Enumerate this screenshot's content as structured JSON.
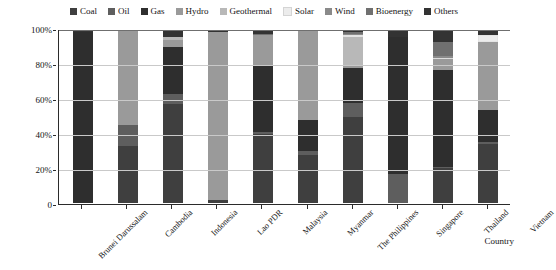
{
  "chart_data": {
    "type": "bar",
    "subtype": "stacked-bar-100-percent",
    "title": "",
    "xlabel": "Country",
    "ylabel": "Power mix",
    "ylim": [
      0,
      100
    ],
    "ytick_labels": [
      "0",
      "20%",
      "40%",
      "60%",
      "80%",
      "100%"
    ],
    "ytick_values": [
      0,
      20,
      40,
      60,
      80,
      100
    ],
    "grid": true,
    "legend_position": "top-center",
    "categories": [
      "Brunei Darussalam",
      "Cambodia",
      "Indonesia",
      "Lao PDR",
      "Malaysia",
      "Myanmar",
      "The Philippines",
      "Singapore",
      "Thailand",
      "Vietnam"
    ],
    "series": [
      {
        "name": "Coal",
        "color": "#3f3f3f",
        "values": [
          0,
          33,
          57,
          2,
          40,
          28,
          50,
          0,
          20,
          34
        ]
      },
      {
        "name": "Oil",
        "color": "#5e5e5e",
        "values": [
          0,
          12,
          6,
          0,
          1,
          2,
          8,
          17,
          1,
          1
        ]
      },
      {
        "name": "Gas",
        "color": "#2e2e2e",
        "values": [
          99,
          0,
          27,
          0,
          38,
          18,
          20,
          79,
          56,
          19
        ]
      },
      {
        "name": "Hydro",
        "color": "#9a9a9a",
        "values": [
          0,
          55,
          4,
          97,
          18,
          52,
          1,
          0,
          6,
          39
        ]
      },
      {
        "name": "Geothermal",
        "color": "#b8b8b8",
        "values": [
          0,
          0,
          2,
          0,
          0,
          0,
          17,
          0,
          0,
          0
        ]
      },
      {
        "name": "Solar",
        "color": "#ececec",
        "values": [
          0,
          0,
          0,
          0,
          0,
          0,
          1,
          0,
          1,
          4
        ]
      },
      {
        "name": "Wind",
        "color": "#8a8a8a",
        "values": [
          0,
          0,
          0,
          0,
          0,
          0,
          1,
          0,
          1,
          0
        ]
      },
      {
        "name": "Bioenergy",
        "color": "#707070",
        "values": [
          0,
          0,
          0,
          0,
          1,
          0,
          1,
          0,
          8,
          0
        ]
      },
      {
        "name": "Others",
        "color": "#333333",
        "values": [
          1,
          0,
          4,
          1,
          2,
          0,
          1,
          4,
          7,
          3
        ]
      }
    ]
  },
  "legend": {
    "items": [
      {
        "label": "Coal",
        "color": "#3f3f3f"
      },
      {
        "label": "Oil",
        "color": "#5e5e5e"
      },
      {
        "label": "Gas",
        "color": "#2e2e2e"
      },
      {
        "label": "Hydro",
        "color": "#9a9a9a"
      },
      {
        "label": "Geothermal",
        "color": "#b8b8b8"
      },
      {
        "label": "Solar",
        "color": "#ececec"
      },
      {
        "label": "Wind",
        "color": "#8a8a8a"
      },
      {
        "label": "Bioenergy",
        "color": "#707070"
      },
      {
        "label": "Others",
        "color": "#333333"
      }
    ]
  }
}
